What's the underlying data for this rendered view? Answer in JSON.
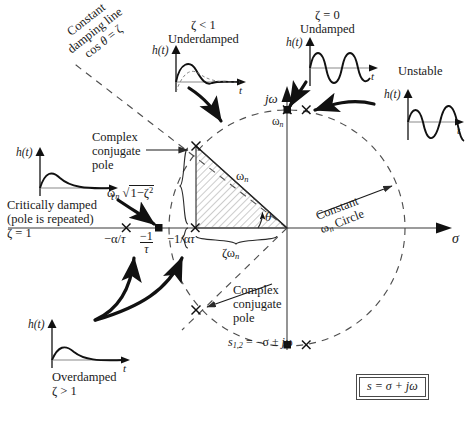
{
  "figure": {
    "axes": {
      "real_label": "σ",
      "imag_label": "jω"
    },
    "formula_box": "s = σ + jω"
  },
  "annotations": {
    "constant_damping_line": {
      "line1": "Constant",
      "line2": "damping line",
      "line3": "cos θ = ζ"
    },
    "constant_wn_circle": {
      "line1": "Constant",
      "line2": "ωn Circle"
    },
    "complex_conjugate_pole_upper": {
      "line1": "Complex",
      "line2": "conjugate",
      "line3": "pole"
    },
    "complex_conjugate_pole_lower": {
      "line1": "Complex",
      "line2": "conjugate",
      "line3": "pole"
    },
    "pole_equation": "s1,2 = −σ ± jω",
    "wn_damped_bracket": "ωn √(1−ζ²)",
    "hypotenuse_label": "ωn",
    "theta_label": "θ",
    "base_label": "ζωn",
    "wn_on_imag_axis": "ωn"
  },
  "real_axis_marks": [
    {
      "label_num": "−α/τ",
      "type": "x"
    },
    {
      "label_num": "−1",
      "label_den": "τ",
      "type": "square"
    },
    {
      "label_num": "−1/ατ",
      "type": "x"
    }
  ],
  "insets": [
    {
      "id": "underdamped",
      "title_line1": "ζ < 1",
      "title_line2": "Underdamped",
      "y_label": "h(t)",
      "x_label": "t",
      "waveform": "damped-overshoot"
    },
    {
      "id": "undamped",
      "title_line1": "ζ = 0",
      "title_line2": "Undamped",
      "y_label": "h(t)",
      "x_label": "t",
      "waveform": "sustained-sine"
    },
    {
      "id": "unstable",
      "title_line1": "Unstable",
      "title_line2": "",
      "y_label": "h(t)",
      "x_label": "t",
      "waveform": "growing-sine"
    },
    {
      "id": "critically-damped",
      "title_line1": "Critically damped",
      "title_line2": "(pole is repeated)",
      "title_line3": "ζ = 1",
      "y_label": "h(t)",
      "x_label": "t",
      "waveform": "critical"
    },
    {
      "id": "overdamped",
      "title_line1": "Overdamped",
      "title_line2": "ζ > 1",
      "y_label": "h(t)",
      "x_label": "t",
      "waveform": "overdamped"
    }
  ],
  "colors": {
    "ink": "#1a1a1a",
    "axis": "#6e6e6e",
    "dashed": "#555555",
    "hatch": "#8a8a8a",
    "arrow": "#111111"
  }
}
